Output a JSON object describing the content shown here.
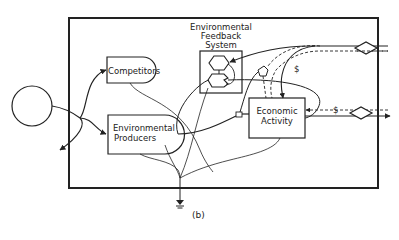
{
  "diagram": {
    "caption": "(b)",
    "nodes": {
      "source": {
        "label": ""
      },
      "competitors": {
        "label": "Competitors"
      },
      "environmental_producers": {
        "line1": "Environmental",
        "line2": "Producers"
      },
      "feedback_system": {
        "line1": "Environmental",
        "line2": "Feedback",
        "line3": "System"
      },
      "economic_activity": {
        "line1": "Economic",
        "line2": "Activity"
      },
      "heat_sink": {
        "label": ""
      }
    },
    "flow_labels": {
      "money_upper": "$",
      "money_lower": "$"
    },
    "colors": {
      "line": "#222222",
      "background": "#ffffff"
    }
  }
}
